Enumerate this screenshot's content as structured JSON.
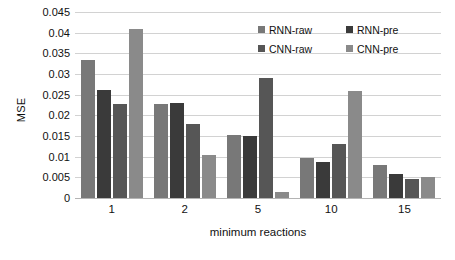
{
  "chart_data": {
    "type": "bar",
    "title": "",
    "xlabel": "minimum reactions",
    "ylabel": "MSE",
    "categories": [
      "1",
      "2",
      "5",
      "10",
      "15"
    ],
    "ylim": [
      0,
      0.045
    ],
    "ytick_labels": [
      "0.045",
      "0.04",
      "0.035",
      "0.03",
      "0.025",
      "0.02",
      "0.015",
      "0.01",
      "0.005",
      "0"
    ],
    "ytick_values": [
      0.045,
      0.04,
      0.035,
      0.03,
      0.025,
      0.02,
      0.015,
      0.01,
      0.005,
      0
    ],
    "grid": true,
    "legend_position": "top-right-inside",
    "series": [
      {
        "name": "RNN-raw",
        "color": "#787878",
        "values": [
          0.0335,
          0.0228,
          0.0152,
          0.0097,
          0.008
        ]
      },
      {
        "name": "RNN-pre",
        "color": "#3a3a3a",
        "values": [
          0.0262,
          0.023,
          0.015,
          0.0088,
          0.0058
        ]
      },
      {
        "name": "CNN-raw",
        "color": "#565656",
        "values": [
          0.0228,
          0.018,
          0.029,
          0.013,
          0.0045
        ]
      },
      {
        "name": "CNN-pre",
        "color": "#8a8a8a",
        "values": [
          0.0408,
          0.0105,
          0.0015,
          0.0258,
          0.005
        ]
      }
    ]
  }
}
